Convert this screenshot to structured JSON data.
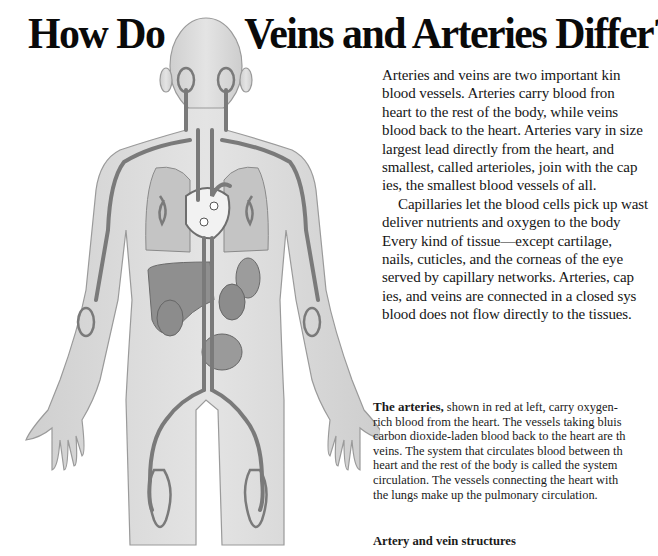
{
  "page": {
    "title_part1": "How Do",
    "title_part2": "Veins and Arteries Differ?",
    "intro_lines": [
      "Arteries and veins are two important kin",
      "blood vessels. Arteries carry blood fron",
      "heart to the rest of the body, while veins",
      "blood back to the heart. Arteries vary in size",
      "largest lead directly from the heart, and",
      "smallest, called arterioles, join with the cap",
      "ies, the smallest blood vessels of all.",
      "Capillaries let the blood cells pick up wast",
      "deliver nutrients and oxygen to the body",
      "Every kind of tissue—except cartilage,",
      "nails, cuticles, and the corneas of the eye",
      "served by capillary networks. Arteries, cap",
      "ies, and veins are connected in a closed sys",
      "blood does not flow directly to the tissues."
    ],
    "caption": {
      "lead": "The arteries,",
      "first_line_rest": " shown in red at left, carry oxygen-",
      "lines": [
        "rich blood from the heart. The vessels taking bluis",
        "carbon dioxide-laden blood back to the heart are th",
        "veins. The system that circulates blood between th",
        "heart and the rest of the body is called the system",
        "circulation. The vessels connecting the heart with",
        "the lungs make up the pulmonary circulation."
      ]
    },
    "subheading": "Artery and vein structures"
  },
  "figure": {
    "colors": {
      "skin": "#d9d9d9",
      "skin_outline": "#9a9a9a",
      "vessel": "#7a7a7a",
      "organ": "#a8a8a8",
      "liver": "#8c8c8c",
      "heart": "#f2f2f2"
    }
  }
}
